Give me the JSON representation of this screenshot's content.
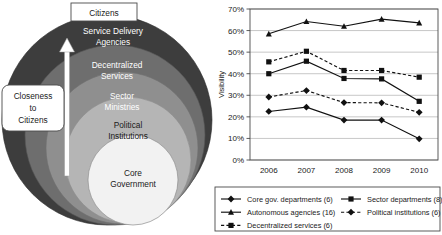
{
  "diagram": {
    "title_box": "Citizens",
    "side_box": "Closeness\nto\nCitizens",
    "side_box_lines": [
      "Closeness",
      "to",
      "Citizens"
    ],
    "arrow": "upward-arrow",
    "rings": [
      {
        "label": "Service Delivery Agencies",
        "lines": [
          "Service Delivery",
          "Agencies"
        ],
        "color": "#3d3d3d",
        "text_color": "#ffffff"
      },
      {
        "label": "Decentralized Services",
        "lines": [
          "Decentralized",
          "Services"
        ],
        "color": "#6e6e6e",
        "text_color": "#ffffff"
      },
      {
        "label": "Sector Ministries",
        "lines": [
          "Sector",
          "Ministries"
        ],
        "color": "#8f8f8f",
        "text_color": "#ffffff"
      },
      {
        "label": "Political Institutions",
        "lines": [
          "Political",
          "Institutions"
        ],
        "color": "#b5b5b5",
        "text_color": "#1a1a1a"
      },
      {
        "label": "Core Government",
        "lines": [
          "Core",
          "Government"
        ],
        "color": "#f2f2f2",
        "text_color": "#1a1a1a"
      }
    ]
  },
  "chart_data": {
    "type": "line",
    "title": "",
    "xlabel": "",
    "ylabel": "Visibility",
    "categories": [
      "2006",
      "2007",
      "2008",
      "2009",
      "2010"
    ],
    "x": [
      2006,
      2007,
      2008,
      2009,
      2010
    ],
    "ylim": [
      0,
      70
    ],
    "ytick_labels": [
      "0%",
      "10%",
      "20%",
      "30%",
      "40%",
      "50%",
      "60%",
      "70%"
    ],
    "ytick_values": [
      0,
      10,
      20,
      30,
      40,
      50,
      60,
      70
    ],
    "grid": true,
    "legend_position": "bottom",
    "series": [
      {
        "name": "Core gov. departments (6)",
        "label": "Core gov. departments (6)",
        "marker": "diamond",
        "style": "solid",
        "values": [
          22.5,
          24.5,
          18.5,
          18.5,
          9.8
        ]
      },
      {
        "name": "Sector departments (8)",
        "label": "Sector departments (8)",
        "marker": "square",
        "style": "solid",
        "values": [
          40.0,
          45.8,
          37.8,
          37.6,
          27.2
        ]
      },
      {
        "name": "Autonomous agencies (16)",
        "label": "Autonomous agencies (16)",
        "marker": "triangle",
        "style": "solid",
        "values": [
          58.5,
          64.2,
          62.0,
          65.3,
          63.6
        ]
      },
      {
        "name": "Political institutions (6)",
        "label": "Political institutions (6)",
        "marker": "diamond",
        "style": "dashed",
        "values": [
          29.2,
          32.2,
          26.6,
          26.5,
          22.1
        ]
      },
      {
        "name": "Decentralized services (6)",
        "label": "Decentralized services (6)",
        "marker": "square",
        "style": "dashed",
        "values": [
          45.5,
          50.4,
          41.5,
          41.5,
          38.4
        ]
      }
    ],
    "legend_columns": [
      [
        "Core gov. departments (6)",
        "Autonomous agencies (16)",
        "Decentralized services (6)"
      ],
      [
        "Sector departments (8)",
        "Political institutions (6)"
      ]
    ]
  },
  "colors": {
    "line": "#111111",
    "grid": "#b9b9b9",
    "frame": "#4a4a4a",
    "background": "#ffffff"
  }
}
